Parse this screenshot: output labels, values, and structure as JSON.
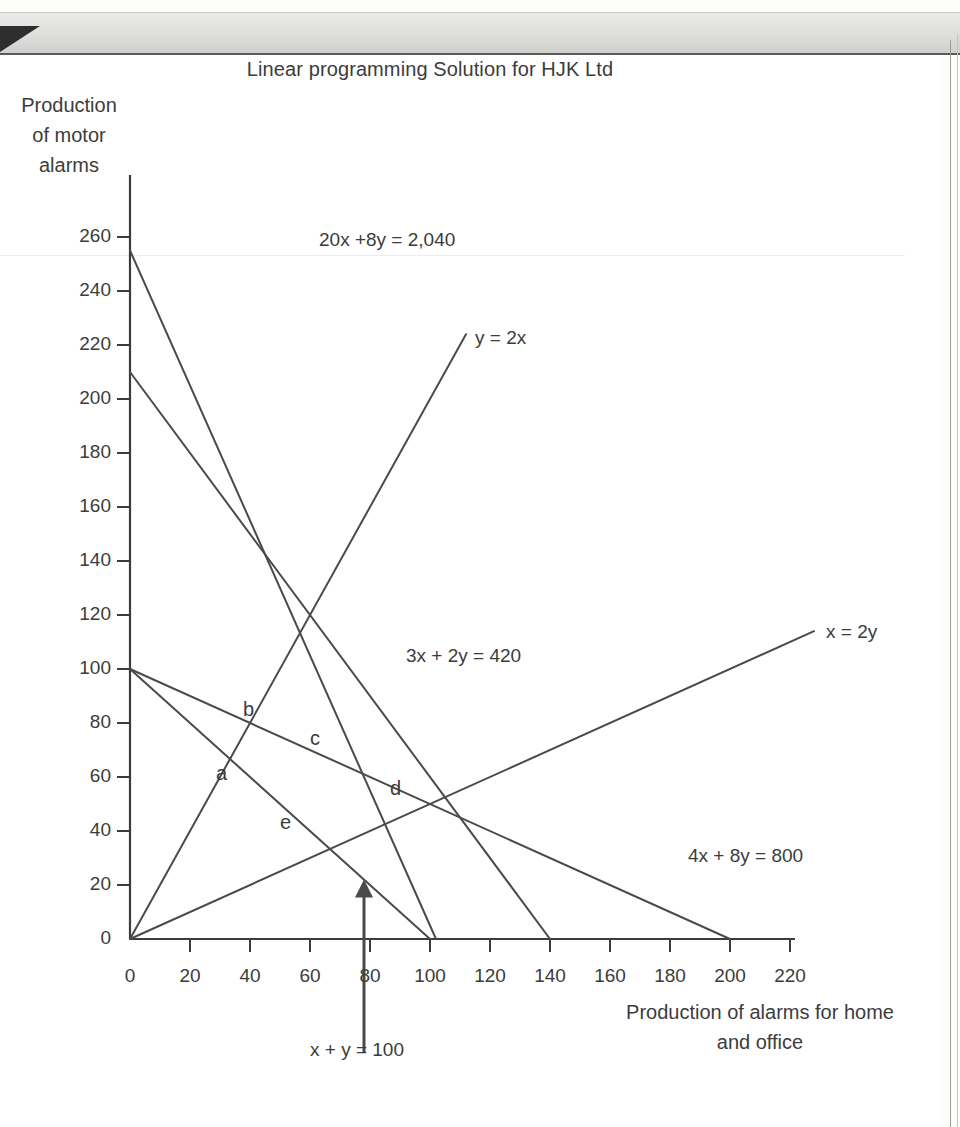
{
  "document": {
    "scan_artifact": "page-edge-shadow"
  },
  "chart_data": {
    "type": "line",
    "title": "Linear programming Solution for HJK Ltd",
    "xlabel": "Production of alarms for home and office",
    "ylabel": "Production of motor alarms",
    "xlim": [
      0,
      230
    ],
    "ylim": [
      0,
      270
    ],
    "xticks": [
      0,
      20,
      40,
      60,
      80,
      100,
      120,
      140,
      160,
      180,
      200,
      220
    ],
    "yticks": [
      0,
      20,
      40,
      60,
      80,
      100,
      120,
      140,
      160,
      180,
      200,
      220,
      240,
      260
    ],
    "grid": false,
    "legend": "inline-annotations",
    "series": [
      {
        "name": "20x +8y = 2,040",
        "label": "20x +8y = 2,040",
        "equation": "20x + 8y = 2040",
        "points": [
          [
            0,
            255
          ],
          [
            102,
            0
          ]
        ],
        "label_x": 63,
        "label_y": 258
      },
      {
        "name": "3x + 2y = 420",
        "label": "3x + 2y = 420",
        "equation": "3x + 2y = 420",
        "points": [
          [
            0,
            210
          ],
          [
            140,
            0
          ]
        ],
        "label_x": 92,
        "label_y": 104
      },
      {
        "name": "x + y = 100",
        "label": "x + y = 100",
        "equation": "x + y = 100",
        "points": [
          [
            0,
            100
          ],
          [
            100,
            0
          ]
        ],
        "label_x": 60,
        "label_y": -42
      },
      {
        "name": "4x + 8y = 800",
        "label": "4x + 8y = 800",
        "equation": "4x + 8y = 800",
        "points": [
          [
            0,
            100
          ],
          [
            200,
            0
          ]
        ],
        "label_x": 186,
        "label_y": 30
      },
      {
        "name": "y = 2x",
        "label": "y = 2x",
        "equation": "y = 2x",
        "points": [
          [
            0,
            0
          ],
          [
            112,
            224
          ]
        ],
        "label_x": 115,
        "label_y": 222
      },
      {
        "name": "x = 2y",
        "label": "x = 2y",
        "equation": "x = 2y",
        "points": [
          [
            0,
            0
          ],
          [
            228,
            114
          ]
        ],
        "label_x": 232,
        "label_y": 113
      }
    ],
    "vertices": [
      {
        "label": "a",
        "x": 36,
        "y": 61
      },
      {
        "label": "b",
        "x": 45,
        "y": 78
      },
      {
        "label": "c",
        "x": 62,
        "y": 68
      },
      {
        "label": "d",
        "x": 88,
        "y": 49
      },
      {
        "label": "e",
        "x": 58,
        "y": 37
      }
    ],
    "annotations": [
      {
        "text": "x + y = 100",
        "arrow_from_x": 78,
        "arrow_from_y": -42,
        "arrow_to_x": 78,
        "arrow_to_y": 22
      }
    ],
    "colors": {
      "line": "#4a4a4a",
      "axis": "#3c3c3c",
      "text": "#3c3c3c",
      "background": "#ffffff"
    }
  }
}
